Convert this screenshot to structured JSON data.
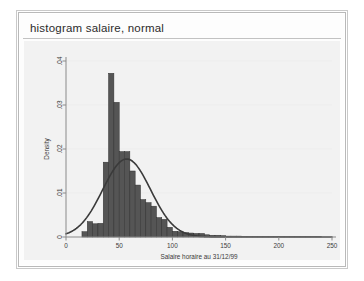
{
  "window": {
    "command_title": "histogram salaire, normal",
    "frame_color": "#b9b9b9",
    "plot_bg": "#f2f2f2",
    "canvas_bg": "#ffffff"
  },
  "chart_data": {
    "type": "bar",
    "title": "",
    "subtitle": "",
    "xlabel": "Salaire horaire au 31/12/99",
    "ylabel": "Density",
    "xlim": [
      0,
      250
    ],
    "ylim": [
      0,
      0.04
    ],
    "xticks": [
      0,
      50,
      100,
      150,
      200,
      250
    ],
    "xticklabels": [
      "0",
      "50",
      "100",
      "150",
      "200",
      "250"
    ],
    "yticks": [
      0,
      0.01,
      0.02,
      0.03,
      0.04
    ],
    "yticklabels": [
      "0",
      ".01",
      ".02",
      ".03",
      ".04"
    ],
    "grid": "horizontal-faint",
    "legend": "none",
    "bar_color": "#555555",
    "bar_edge_color": "#2f2f2f",
    "curve_color": "#3a3a3a",
    "bin_width": 5,
    "bin_starts": [
      15,
      20,
      25,
      30,
      35,
      40,
      45,
      50,
      55,
      60,
      65,
      70,
      75,
      80,
      85,
      90,
      95,
      100,
      105,
      110,
      115,
      120,
      125,
      130,
      135,
      140,
      145,
      150,
      155,
      160,
      165,
      170,
      175,
      180,
      185,
      190,
      195,
      200,
      205,
      210,
      215,
      220,
      225,
      230,
      235
    ],
    "values": [
      0.0012,
      0.0035,
      0.003,
      0.0031,
      0.017,
      0.0372,
      0.0306,
      0.0194,
      0.0194,
      0.015,
      0.0118,
      0.0085,
      0.0078,
      0.007,
      0.0044,
      0.004,
      0.0022,
      0.0013,
      0.0012,
      0.001,
      0.0009,
      0.0008,
      0.0008,
      0.0005,
      0.0004,
      0.0004,
      0.0003,
      0.0002,
      0.0002,
      0.0002,
      0.0001,
      0.0001,
      0.0001,
      0.0001,
      0.0001,
      0.0001,
      0.0001,
      0.0001,
      0.0001,
      0.0001,
      0.0001,
      0.0001,
      0.0001,
      0.0001,
      0.0001
    ],
    "normal_overlay": {
      "shown": true,
      "mean": 57,
      "sd": 22.5,
      "peak_density": 0.0185
    }
  }
}
